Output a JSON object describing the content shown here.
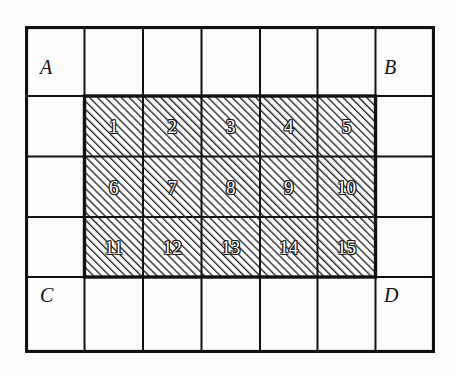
{
  "figure": {
    "background_color": "#fdfdfd",
    "line_color": "#111111",
    "hatch_color": "#1a1a1a",
    "number_fill_color": "#ffffff",
    "grid": {
      "columns": 7,
      "rows": 5,
      "outer_border_width_px": 3,
      "inner_line_width_px": 2
    },
    "hatched_region": {
      "fill": "diagonal-hatch",
      "hatch_direction": "forward-slash",
      "hatch_spacing_px": 4,
      "columns": 5,
      "rows": 3,
      "start_column": 2,
      "start_row": 2
    },
    "corner_labels": [
      {
        "id": "A",
        "text": "A",
        "corner": "top-left"
      },
      {
        "id": "B",
        "text": "B",
        "corner": "top-right"
      },
      {
        "id": "C",
        "text": "C",
        "corner": "bottom-right"
      },
      {
        "id": "D",
        "text": "D",
        "corner": "bottom-left"
      }
    ],
    "cell_numbers": [
      {
        "label": "1",
        "row": 1,
        "col": 1
      },
      {
        "label": "2",
        "row": 1,
        "col": 2
      },
      {
        "label": "3",
        "row": 1,
        "col": 3
      },
      {
        "label": "4",
        "row": 1,
        "col": 4
      },
      {
        "label": "5",
        "row": 1,
        "col": 5
      },
      {
        "label": "6",
        "row": 2,
        "col": 1
      },
      {
        "label": "7",
        "row": 2,
        "col": 2
      },
      {
        "label": "8",
        "row": 2,
        "col": 3
      },
      {
        "label": "9",
        "row": 2,
        "col": 4
      },
      {
        "label": "10",
        "row": 2,
        "col": 5
      },
      {
        "label": "11",
        "row": 3,
        "col": 1
      },
      {
        "label": "12",
        "row": 3,
        "col": 2
      },
      {
        "label": "13",
        "row": 3,
        "col": 3
      },
      {
        "label": "14",
        "row": 3,
        "col": 4
      },
      {
        "label": "15",
        "row": 3,
        "col": 5
      }
    ]
  }
}
